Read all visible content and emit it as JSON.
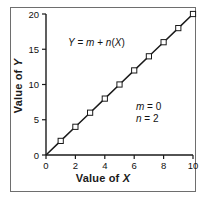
{
  "figure": {
    "background_color": "#ffffff",
    "frame_color": "#6e6e6e"
  },
  "axis": {
    "x_title_prefix": "Value of ",
    "x_title_var": "X",
    "y_title_prefix": "Value of ",
    "y_title_var": "Y"
  },
  "annotations": {
    "equation_y": "Y",
    "equation_eq": " = ",
    "equation_m": "m",
    "equation_plus": " + ",
    "equation_n": "n",
    "equation_open": "(",
    "equation_x": "X",
    "equation_close": ")",
    "equation_full": "Y = m + n(X)",
    "param_m_name": "m",
    "param_m_eq": " = ",
    "param_m_value": "0",
    "param_n_name": "n",
    "param_n_eq": " = ",
    "param_n_value": "2",
    "param_m_full": "m = 0",
    "param_n_full": "n = 2"
  },
  "chart_data": {
    "type": "line",
    "title": "",
    "subtitle": "",
    "xlabel": "Value of X",
    "ylabel": "Value of Y",
    "xlim": [
      0,
      10
    ],
    "ylim": [
      0,
      20
    ],
    "xticks": [
      0,
      2,
      4,
      6,
      8,
      10
    ],
    "xtick_labels": [
      "0",
      "2",
      "4",
      "6",
      "8",
      "10"
    ],
    "yticks": [
      0,
      5,
      10,
      15,
      20
    ],
    "ytick_labels": [
      "0",
      "5",
      "10",
      "15",
      "20"
    ],
    "grid": false,
    "legend": null,
    "marker": "open-square",
    "line_color": "#1a1a1a",
    "marker_face_color": "#ffffff",
    "marker_edge_color": "#1a1a1a",
    "equation": "Y = m + n(X)",
    "parameters": {
      "m": 0,
      "n": 2
    },
    "series": [
      {
        "name": "Y = m + n(X)",
        "x": [
          0,
          1,
          2,
          3,
          4,
          5,
          6,
          7,
          8,
          9,
          10
        ],
        "values": [
          0,
          2,
          4,
          6,
          8,
          10,
          12,
          14,
          16,
          18,
          20
        ]
      }
    ],
    "annotations": [
      {
        "text": "Y = m + n(X)",
        "x": 2.6,
        "y": 17.2
      },
      {
        "text": "m = 0",
        "x": 7.0,
        "y": 7.3
      },
      {
        "text": "n = 2",
        "x": 7.0,
        "y": 6.0
      }
    ]
  }
}
